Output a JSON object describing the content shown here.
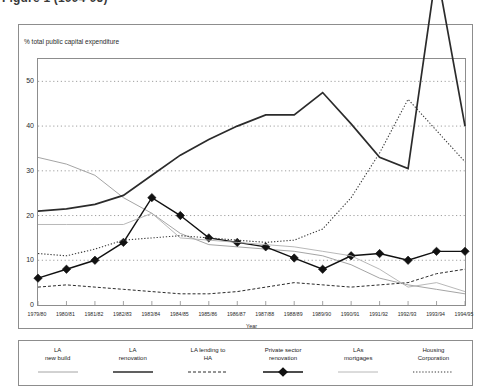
{
  "caption": "Figure 1 (1994-95)",
  "chart": {
    "ylabel": "% total public capital expenditure",
    "xlabel": "Year"
  },
  "chart_data": {
    "type": "line",
    "title": "",
    "subtitle": "",
    "xlabel": "Year",
    "ylabel": "% total public capital expenditure",
    "ylim": [
      0,
      55
    ],
    "yticks": [
      0,
      10,
      20,
      30,
      40,
      50
    ],
    "grid": "horizontal-dotted",
    "legend_position": "below-chart",
    "categories": [
      "1979/80",
      "1980/81",
      "1981/82",
      "1982/83",
      "1983/84",
      "1984/85",
      "1985/86",
      "1986/87",
      "1987/88",
      "1988/89",
      "1989/90",
      "1990/91",
      "1991/92",
      "1992/93",
      "1993/94",
      "1994/95"
    ],
    "series": [
      {
        "name": "LA new build",
        "style": "thin-solid-grey",
        "color": "#9a9a9a",
        "values": [
          33,
          31.5,
          29,
          24,
          20.5,
          16,
          13.5,
          13,
          12.5,
          12,
          11,
          9,
          6,
          4.5,
          3.5,
          2.5
        ]
      },
      {
        "name": "LA renovation",
        "style": "thick-solid-black",
        "color": "#2b2b2b",
        "values": [
          21,
          21.5,
          22.5,
          24.5,
          29,
          33.5,
          37,
          40,
          42.5,
          42.5,
          47.5,
          40.5,
          33,
          30.5,
          75,
          40
        ]
      },
      {
        "name": "LA lending to HA",
        "style": "dashed-black",
        "color": "#2b2b2b",
        "values": [
          4,
          4.5,
          4,
          3.5,
          3,
          2.5,
          2.5,
          3,
          4,
          5,
          4.5,
          4,
          4.5,
          5,
          7,
          8
        ]
      },
      {
        "name": "Private sector renovation",
        "style": "diamond-marker-black",
        "color": "#111111",
        "values": [
          6,
          8,
          10,
          14,
          24,
          20,
          15,
          14,
          13,
          10.5,
          8,
          11,
          11.5,
          10,
          12,
          12
        ]
      },
      {
        "name": "LAs mortgages",
        "style": "thin-solid-lightgrey",
        "color": "#b0b0b0",
        "values": [
          18,
          18,
          18,
          18,
          20.5,
          15,
          14.5,
          14,
          13.5,
          13,
          12,
          11,
          8,
          4,
          5,
          3
        ]
      },
      {
        "name": "Housing Corporation",
        "style": "dotted-black",
        "color": "#3a3a3a",
        "values": [
          11.5,
          11,
          12.5,
          14.5,
          15,
          15.5,
          15,
          14.5,
          14,
          14.5,
          17,
          24,
          34,
          46,
          39,
          32
        ]
      }
    ]
  },
  "legend": {
    "items": [
      {
        "label": "LA\nnew build",
        "swatch": "thin-solid-grey"
      },
      {
        "label": "LA\nrenovation",
        "swatch": "thick-solid-black"
      },
      {
        "label": "LA lending to\nHA",
        "swatch": "dashed-black"
      },
      {
        "label": "Private sector\nrenovation",
        "swatch": "diamond-marker-black"
      },
      {
        "label": "LAs\nmortgages",
        "swatch": "thin-solid-lightgrey"
      },
      {
        "label": "Housing\nCorporation",
        "swatch": "dotted-black"
      }
    ]
  }
}
